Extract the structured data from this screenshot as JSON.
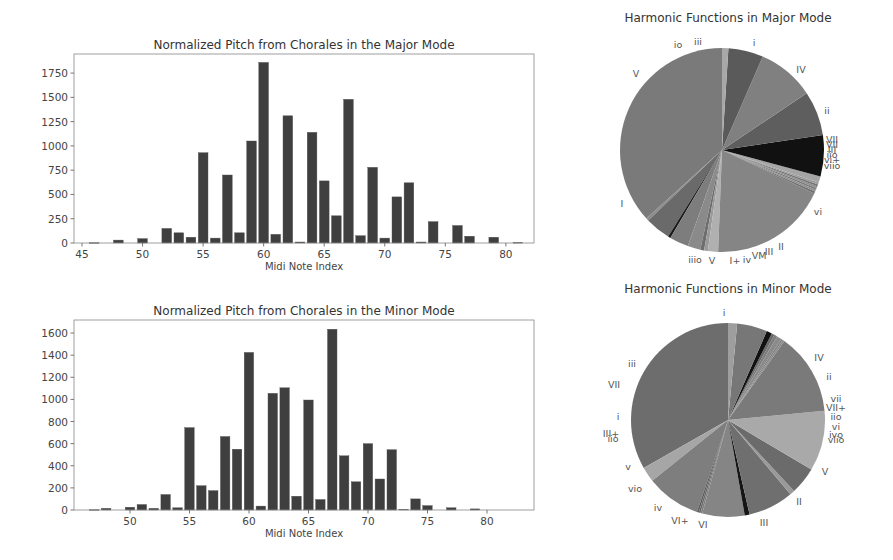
{
  "chart_data": [
    {
      "id": "major_pitch",
      "type": "bar",
      "title": "Normalized Pitch from Chorales in the Major Mode",
      "xlabel": "Midi Note Index",
      "ylabel": "",
      "xlim": [
        44,
        83
      ],
      "ylim": [
        0,
        1950
      ],
      "xticks": [
        45,
        50,
        55,
        60,
        65,
        70,
        75,
        80
      ],
      "yticks": [
        0,
        250,
        500,
        750,
        1000,
        1250,
        1500,
        1750
      ],
      "grid": false,
      "bar_color": "#3f3f3f",
      "x": [
        46,
        48,
        50,
        52,
        53,
        54,
        55,
        56,
        57,
        58,
        59,
        60,
        61,
        62,
        63,
        64,
        65,
        66,
        67,
        68,
        69,
        70,
        71,
        72,
        73,
        74,
        76,
        77,
        79,
        81
      ],
      "values": [
        3,
        30,
        45,
        150,
        105,
        60,
        930,
        50,
        700,
        105,
        1050,
        1860,
        90,
        1310,
        10,
        1140,
        640,
        280,
        1480,
        75,
        780,
        50,
        475,
        620,
        10,
        220,
        180,
        70,
        60,
        5
      ]
    },
    {
      "id": "minor_pitch",
      "type": "bar",
      "title": "Normalized Pitch from Chorales in the Minor Mode",
      "xlabel": "Midi Note Index",
      "ylabel": "",
      "xlim": [
        45,
        84
      ],
      "ylim": [
        0,
        1720
      ],
      "xticks": [
        50,
        55,
        60,
        65,
        70,
        75,
        80
      ],
      "yticks": [
        0,
        200,
        400,
        600,
        800,
        1000,
        1200,
        1400,
        1600
      ],
      "grid": false,
      "bar_color": "#3f3f3f",
      "x": [
        47,
        48,
        50,
        51,
        52,
        53,
        54,
        55,
        56,
        57,
        58,
        59,
        60,
        61,
        62,
        63,
        64,
        65,
        66,
        67,
        68,
        69,
        70,
        71,
        72,
        73,
        74,
        75,
        77,
        79
      ],
      "values": [
        3,
        15,
        25,
        50,
        15,
        140,
        20,
        745,
        220,
        175,
        665,
        550,
        1425,
        35,
        1055,
        1105,
        125,
        995,
        95,
        1635,
        490,
        255,
        600,
        280,
        545,
        5,
        100,
        40,
        20,
        10
      ]
    },
    {
      "id": "major_harmonic",
      "type": "pie",
      "title": "Harmonic Functions in Major Mode",
      "start_angle_deg": 90,
      "direction": "counterclockwise",
      "labels": [
        "I",
        "iiio",
        "V",
        "I+",
        "iv",
        "VI",
        "VII",
        "III",
        "II",
        "vi",
        "viio",
        "vi+",
        "III+",
        "iio",
        "VII+",
        "VII",
        "vii",
        "ii",
        "IV",
        "i",
        "iii",
        "io",
        "V"
      ],
      "labels_display": [
        "I",
        "iiio",
        "V",
        "I+",
        "iv",
        "VI",
        "VII",
        "III",
        "II",
        "vi",
        "viio",
        "vi+",
        "III+",
        "iio",
        "VII+",
        "VII",
        "vii",
        "ii",
        "IV",
        "i",
        "iii",
        "io",
        "V"
      ],
      "values": [
        36.5,
        0.4,
        4.0,
        0.4,
        3.0,
        2.0,
        0.6,
        0.6,
        1.6,
        18.5,
        0.3,
        0.3,
        0.3,
        0.3,
        0.3,
        0.3,
        1.0,
        6.5,
        7.0,
        9.0,
        5.5,
        1.0,
        0.0
      ],
      "colors": [
        "#7a7a7a",
        "#8c8c8c",
        "#6a6a6a",
        "#1a1a1a",
        "#7d7d7d",
        "#8a8a8a",
        "#6e6e6e",
        "#9a9a9a",
        "#b0b0b0",
        "#858585",
        "#6f6f6f",
        "#909090",
        "#7b7b7b",
        "#8e8e8e",
        "#737373",
        "#9c9c9c",
        "#a5a5a5",
        "#111111",
        "#5e5e5e",
        "#808080",
        "#5a5a5a",
        "#a8a8a8",
        "#7a7a7a"
      ]
    },
    {
      "id": "minor_harmonic",
      "type": "pie",
      "title": "Harmonic Functions in Minor Mode",
      "start_angle_deg": 90,
      "direction": "counterclockwise",
      "labels": [
        "i",
        "iii",
        "VII",
        "i",
        "III+",
        "iio",
        "v",
        "viio",
        "iv",
        "VI+",
        "VI",
        "III",
        "II",
        "V",
        "viio",
        "ivo",
        "vi",
        "iio",
        "VII+",
        "vii",
        "ii",
        "IV"
      ],
      "values": [
        33.0,
        2.5,
        9.0,
        0.3,
        0.3,
        0.3,
        7.0,
        0.8,
        7.5,
        0.8,
        4.5,
        10.0,
        0.0,
        13.5,
        0.3,
        0.3,
        0.8,
        0.5,
        0.5,
        0.9,
        5.0,
        1.5
      ],
      "colors": [
        "#6d6d6d",
        "#a6a6a6",
        "#7e7e7e",
        "#5c5c5c",
        "#6a6a6a",
        "#7e7e7e",
        "#858585",
        "#151515",
        "#6f6f6f",
        "#9a9a9a",
        "#6b6b6b",
        "#a9a9a9",
        "#a0a0a0",
        "#7a7a7a",
        "#8b8b8b",
        "#7f7f7f",
        "#8a8a8a",
        "#7d7d7d",
        "#6a6a6a",
        "#111111",
        "#777777",
        "#9e9e9e"
      ]
    }
  ],
  "layout": {
    "major_bar": {
      "left": 74,
      "top": 54,
      "right": 534,
      "bottom": 243,
      "x0_val": 45,
      "x0_px": 82,
      "px_per_x": 12.11,
      "px_per_y": 0.0971
    },
    "minor_bar": {
      "left": 74,
      "top": 320,
      "right": 534,
      "bottom": 510,
      "x0_val": 50,
      "x0_px": 130,
      "px_per_x": 11.9,
      "px_per_y": 0.1106
    },
    "major_pie": {
      "cx": 722,
      "cy": 150,
      "r": 102,
      "title_y": 22,
      "labels": [
        {
          "t": "I",
          "x": 622,
          "y": 207
        },
        {
          "t": "iiio",
          "x": 695,
          "y": 263
        },
        {
          "t": "V",
          "x": 712,
          "y": 264
        },
        {
          "t": "I+",
          "x": 735,
          "y": 264
        },
        {
          "t": "iv",
          "x": 747,
          "y": 263
        },
        {
          "t": "VM",
          "x": 759,
          "y": 259
        },
        {
          "t": "III",
          "x": 769,
          "y": 255
        },
        {
          "t": "II",
          "x": 781,
          "y": 250
        },
        {
          "t": "vi",
          "x": 818,
          "y": 215
        },
        {
          "t": "VII",
          "x": 832,
          "y": 143
        },
        {
          "t": "VII",
          "x": 832,
          "y": 148
        },
        {
          "t": "III",
          "x": 832,
          "y": 153
        },
        {
          "t": "iio",
          "x": 832,
          "y": 158
        },
        {
          "t": "vi+",
          "x": 832,
          "y": 163
        },
        {
          "t": "viio",
          "x": 832,
          "y": 169
        },
        {
          "t": "ii",
          "x": 827,
          "y": 114
        },
        {
          "t": "IV",
          "x": 801,
          "y": 73
        },
        {
          "t": "i",
          "x": 754,
          "y": 46
        },
        {
          "t": "iii",
          "x": 698,
          "y": 45
        },
        {
          "t": "io",
          "x": 678,
          "y": 48
        },
        {
          "t": "V",
          "x": 636,
          "y": 77
        }
      ]
    },
    "minor_pie": {
      "cx": 728,
      "cy": 420,
      "r": 97,
      "title_y": 293,
      "labels": [
        {
          "t": "i",
          "x": 724,
          "y": 316
        },
        {
          "t": "IV",
          "x": 819,
          "y": 361
        },
        {
          "t": "ii",
          "x": 829,
          "y": 380
        },
        {
          "t": "vii",
          "x": 836,
          "y": 402
        },
        {
          "t": "VII+",
          "x": 836,
          "y": 411
        },
        {
          "t": "iio",
          "x": 836,
          "y": 420
        },
        {
          "t": "vi",
          "x": 836,
          "y": 430
        },
        {
          "t": "ivo",
          "x": 836,
          "y": 438
        },
        {
          "t": "viio",
          "x": 836,
          "y": 443
        },
        {
          "t": "V",
          "x": 825,
          "y": 475
        },
        {
          "t": "II",
          "x": 799,
          "y": 505
        },
        {
          "t": "III",
          "x": 764,
          "y": 526
        },
        {
          "t": "VI",
          "x": 703,
          "y": 528
        },
        {
          "t": "VI+",
          "x": 680,
          "y": 524
        },
        {
          "t": "iv",
          "x": 658,
          "y": 511
        },
        {
          "t": "vio",
          "x": 635,
          "y": 492
        },
        {
          "t": "v",
          "x": 628,
          "y": 470
        },
        {
          "t": "III+",
          "x": 611,
          "y": 437
        },
        {
          "t": "iio",
          "x": 613,
          "y": 442
        },
        {
          "t": "i",
          "x": 618,
          "y": 420
        },
        {
          "t": "VII",
          "x": 614,
          "y": 388
        },
        {
          "t": "iii",
          "x": 632,
          "y": 367
        }
      ]
    }
  }
}
